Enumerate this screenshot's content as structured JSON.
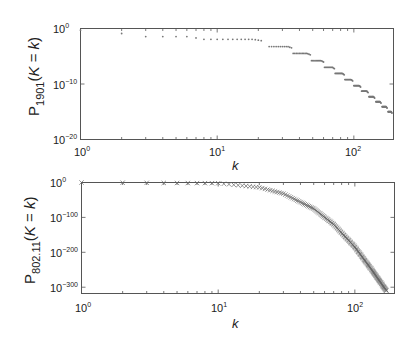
{
  "chart_data": [
    {
      "type": "scatter",
      "panel": "top",
      "ylabel_main": "P",
      "ylabel_sub": "1901",
      "ylabel_rest": "(K = k)",
      "ylabel_italic_k": "k",
      "xlabel": "k",
      "xscale": "log",
      "yscale": "log",
      "xlim": [
        1,
        195
      ],
      "ylim_exp": [
        -20,
        0
      ],
      "x_ticks": [
        {
          "base": "10",
          "exp": "0",
          "value": 1
        },
        {
          "base": "10",
          "exp": "1",
          "value": 10
        },
        {
          "base": "10",
          "exp": "2",
          "value": 100
        }
      ],
      "y_ticks": [
        {
          "base": "10",
          "exp": "0",
          "value_exp": 0
        },
        {
          "base": "10",
          "exp": "−10",
          "value_exp": -10
        },
        {
          "base": "10",
          "exp": "−20",
          "value_exp": -20
        }
      ],
      "marker": "dot",
      "color": "#777777",
      "steps": [
        {
          "k_from": 1,
          "k_to": 1,
          "log10_p": -0.3
        },
        {
          "k_from": 2,
          "k_to": 2,
          "log10_p": -0.9
        },
        {
          "k_from": 3,
          "k_to": 7,
          "log10_p": -1.45
        },
        {
          "k_from": 8,
          "k_to": 21,
          "log10_p": -1.95
        },
        {
          "k_from": 24,
          "k_to": 35,
          "log10_p": -3.25
        },
        {
          "k_from": 36,
          "k_to": 48,
          "log10_p": -4.5
        },
        {
          "k_from": 49,
          "k_to": 60,
          "log10_p": -5.8
        },
        {
          "k_from": 61,
          "k_to": 72,
          "log10_p": -7.0
        },
        {
          "k_from": 73,
          "k_to": 85,
          "log10_p": -8.1
        },
        {
          "k_from": 86,
          "k_to": 98,
          "log10_p": -9.2
        },
        {
          "k_from": 100,
          "k_to": 112,
          "log10_p": -10.3
        },
        {
          "k_from": 114,
          "k_to": 127,
          "log10_p": -11.3
        },
        {
          "k_from": 129,
          "k_to": 142,
          "log10_p": -12.3
        },
        {
          "k_from": 145,
          "k_to": 158,
          "log10_p": -13.2
        },
        {
          "k_from": 161,
          "k_to": 175,
          "log10_p": -14.1
        },
        {
          "k_from": 178,
          "k_to": 190,
          "log10_p": -15.0
        }
      ]
    },
    {
      "type": "scatter",
      "panel": "bottom",
      "ylabel_main": "P",
      "ylabel_sub": "802.11",
      "ylabel_rest": "(K = k)",
      "xlabel": "k",
      "xscale": "log",
      "yscale": "log",
      "xlim": [
        1,
        195
      ],
      "ylim_exp": [
        -318,
        0
      ],
      "x_ticks": [
        {
          "base": "10",
          "exp": "0",
          "value": 1
        },
        {
          "base": "10",
          "exp": "1",
          "value": 10
        },
        {
          "base": "10",
          "exp": "2",
          "value": 100
        }
      ],
      "y_ticks": [
        {
          "base": "10",
          "exp": "0",
          "value_exp": 0
        },
        {
          "base": "10",
          "exp": "−100",
          "value_exp": -100
        },
        {
          "base": "10",
          "exp": "−200",
          "value_exp": -200
        },
        {
          "base": "10",
          "exp": "−300",
          "value_exp": -300
        }
      ],
      "marker": "x",
      "color": "#666666",
      "curve_points": [
        {
          "k": 1,
          "log10_p": 0
        },
        {
          "k": 10,
          "log10_p": -2
        },
        {
          "k": 20,
          "log10_p": -14
        },
        {
          "k": 30,
          "log10_p": -32
        },
        {
          "k": 50,
          "log10_p": -75
        },
        {
          "k": 70,
          "log10_p": -120
        },
        {
          "k": 100,
          "log10_p": -185
        },
        {
          "k": 130,
          "log10_p": -245
        },
        {
          "k": 170,
          "log10_p": -310
        }
      ],
      "k_max": 170
    }
  ]
}
